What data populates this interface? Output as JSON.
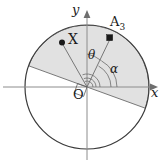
{
  "figure": {
    "background_color": "#ffffff",
    "axes": {
      "y_label": "y",
      "x_label": "x",
      "origin_label": "O",
      "axis_color": "#8c8c8c"
    },
    "circle": {
      "center_x": 87,
      "center_y": 87,
      "radius": 62,
      "stroke_color": "#3a3a3a"
    },
    "sector": {
      "fill_color": "#dedede",
      "stroke_color": "#6b6b6b",
      "start_angle_deg": -20,
      "end_angle_deg": 160,
      "description": "shaded half-disk rotated 20 degrees clockwise"
    },
    "points": [
      {
        "id": "X",
        "label": "X",
        "marker": "filled-circle",
        "x": 62,
        "y": 42,
        "color": "#1a1a1a"
      },
      {
        "id": "A3",
        "label": "A",
        "subscript": "3",
        "marker": "filled-square",
        "x": 110,
        "y": 38,
        "color": "#1a1a1a"
      }
    ],
    "angles": [
      {
        "id": "theta",
        "label": "θ",
        "from": "y-axis",
        "to": "OA3",
        "description": "angle between positive y-axis and ray to A3"
      },
      {
        "id": "alpha",
        "label": "α",
        "from": "x-axis",
        "to": "OA3",
        "description": "angle between positive x-axis and ray to A3"
      }
    ],
    "markers": {
      "right_angle": "small square at origin indicating sector boundary",
      "y_arrow": "arrow-up-icon",
      "x_arrow": "arrow-right-icon"
    }
  }
}
